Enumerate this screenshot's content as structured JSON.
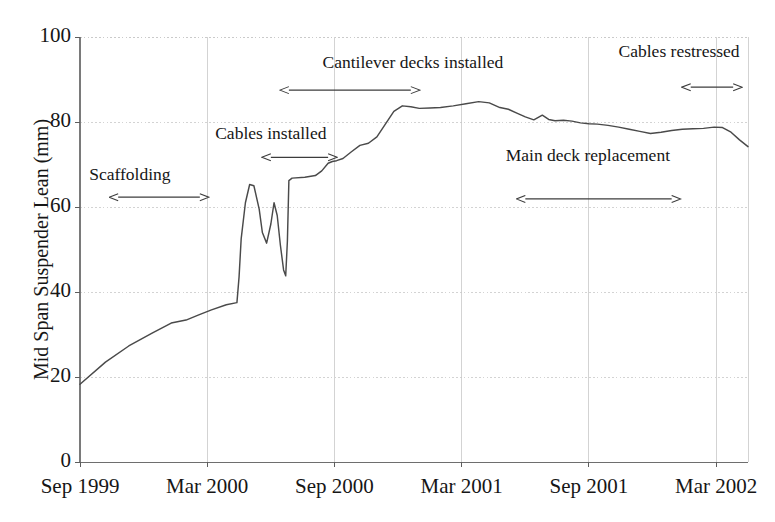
{
  "chart_data": {
    "type": "line",
    "title": "",
    "xlabel": "",
    "ylabel": "Mid Span Suspender Lean (mm)",
    "ylim": [
      0,
      100
    ],
    "yticks": [
      0,
      20,
      40,
      60,
      80,
      100
    ],
    "ytick_labels": [
      "0",
      "20",
      "40",
      "60",
      "80",
      "100"
    ],
    "xtick_labels": [
      "Sep 1999",
      "Mar 2000",
      "Sep 2000",
      "Mar 2001",
      "Sep 2001",
      "Mar 2002"
    ],
    "xtick_months": [
      0,
      6,
      12,
      18,
      24,
      30
    ],
    "xlim_months": [
      0,
      31.5
    ],
    "grid": true,
    "legend": null,
    "line_color": "#4a4a4a",
    "grid_color": "#c8c8c8",
    "series": [
      {
        "name": "Mid span suspender lean",
        "x_months": [
          0.0,
          1.2,
          2.3,
          3.4,
          4.3,
          5.0,
          5.6,
          6.2,
          6.9,
          7.4,
          7.5,
          7.6,
          7.8,
          8.0,
          8.2,
          8.45,
          8.6,
          8.8,
          9.0,
          9.15,
          9.3,
          9.45,
          9.6,
          9.7,
          9.78,
          9.85,
          10.0,
          10.6,
          11.1,
          11.4,
          11.7,
          11.9,
          12.1,
          12.4,
          12.8,
          13.2,
          13.6,
          14.0,
          14.4,
          14.8,
          15.2,
          15.6,
          16.0,
          16.5,
          17.0,
          17.6,
          18.2,
          18.8,
          19.3,
          19.8,
          20.2,
          20.6,
          21.0,
          21.4,
          21.8,
          22.1,
          22.4,
          22.8,
          23.2,
          23.6,
          24.0,
          24.4,
          24.9,
          25.4,
          25.9,
          26.4,
          26.9,
          27.4,
          27.9,
          28.4,
          28.9,
          29.4,
          29.9,
          30.3,
          30.7,
          31.1,
          31.5
        ],
        "y_mm": [
          18.3,
          23.5,
          27.3,
          30.3,
          32.7,
          33.4,
          34.6,
          35.8,
          37.0,
          37.5,
          43.5,
          52.5,
          61.0,
          65.3,
          65.0,
          59.5,
          54.0,
          51.5,
          56.0,
          61.0,
          58.0,
          51.0,
          45.2,
          43.8,
          52.0,
          66.2,
          66.8,
          67.0,
          67.4,
          68.5,
          70.3,
          70.7,
          70.9,
          71.4,
          73.0,
          74.5,
          75.0,
          76.5,
          79.5,
          82.5,
          83.8,
          83.6,
          83.2,
          83.3,
          83.4,
          83.8,
          84.3,
          84.8,
          84.5,
          83.4,
          83.0,
          82.1,
          81.2,
          80.5,
          81.6,
          80.6,
          80.3,
          80.4,
          80.2,
          79.8,
          79.6,
          79.5,
          79.2,
          78.8,
          78.3,
          77.8,
          77.3,
          77.6,
          78.0,
          78.3,
          78.4,
          78.5,
          78.8,
          78.7,
          77.6,
          75.8,
          74.2
        ]
      }
    ],
    "annotations": [
      {
        "id": "scaffolding",
        "label": "Scaffolding",
        "label_x_months": 2.35,
        "label_y_mm": 67.5,
        "arrow_start_months": 1.8,
        "arrow_end_months": 5.65,
        "arrow_y_mm": 62.3,
        "arrow_style": "double"
      },
      {
        "id": "cables-installed",
        "label": "Cables installed",
        "label_x_months": 9.0,
        "label_y_mm": 77.2,
        "arrow_start_months": 9.0,
        "arrow_end_months": 11.7,
        "arrow_y_mm": 71.7,
        "arrow_style": "double"
      },
      {
        "id": "cantilever-decks-installed",
        "label": "Cantilever decks installed",
        "label_x_months": 15.7,
        "label_y_mm": 94.0,
        "arrow_start_months": 9.85,
        "arrow_end_months": 15.6,
        "arrow_y_mm": 87.5,
        "arrow_style": "double"
      },
      {
        "id": "main-deck-replacement",
        "label": "Main deck replacement",
        "label_x_months": 23.95,
        "label_y_mm": 72.0,
        "arrow_start_months": 21.0,
        "arrow_end_months": 27.9,
        "arrow_y_mm": 61.9,
        "arrow_style": "double"
      },
      {
        "id": "cables-restressed",
        "label": "Cables restressed",
        "label_x_months": 28.25,
        "label_y_mm": 96.5,
        "arrow_start_months": 28.8,
        "arrow_end_months": 30.8,
        "arrow_y_mm": 88.2,
        "arrow_style": "double"
      }
    ]
  }
}
